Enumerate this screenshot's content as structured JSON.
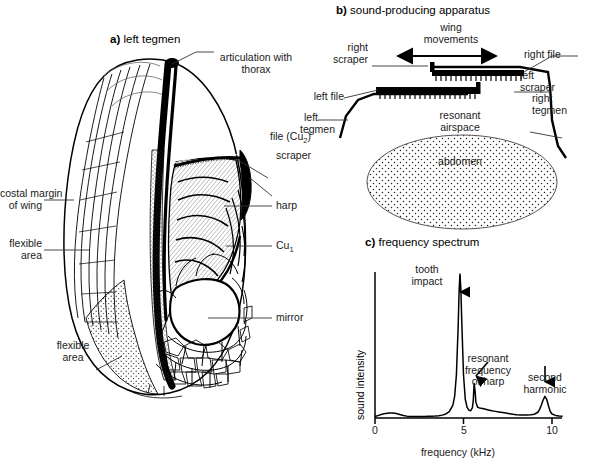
{
  "figure": {
    "panels": [
      {
        "id": "a",
        "marker": "a)",
        "title": "left tegmen",
        "labels": [
          {
            "name": "articulation-with-thorax",
            "text": "articulation with\nthorax"
          },
          {
            "name": "file-cu2",
            "text": "file (Cu2)"
          },
          {
            "name": "scraper",
            "text": "scraper"
          },
          {
            "name": "harp",
            "text": "harp"
          },
          {
            "name": "cu1",
            "text": "Cu1"
          },
          {
            "name": "mirror",
            "text": "mirror"
          },
          {
            "name": "costal-margin-of-wing",
            "text": "costal margin\nof wing"
          },
          {
            "name": "flexible-area-upper",
            "text": "flexible\narea"
          },
          {
            "name": "flexible-area-lower",
            "text": "flexible\narea"
          }
        ]
      },
      {
        "id": "b",
        "marker": "b)",
        "title": "sound-producing apparatus",
        "labels": [
          {
            "name": "wing-movements",
            "text": "wing\nmovements"
          },
          {
            "name": "right-scraper",
            "text": "right\nscraper"
          },
          {
            "name": "right-file",
            "text": "right file"
          },
          {
            "name": "left-file",
            "text": "left file"
          },
          {
            "name": "left-scraper",
            "text": "left\nscraper"
          },
          {
            "name": "left-tegmen",
            "text": "left\ntegmen"
          },
          {
            "name": "right-tegmen",
            "text": "right\ntegmen"
          },
          {
            "name": "resonant-airspace",
            "text": "resonant\nairspace"
          },
          {
            "name": "abdomen",
            "text": "abdomen"
          }
        ]
      },
      {
        "id": "c",
        "marker": "c)",
        "title": "frequency spectrum"
      }
    ]
  },
  "panel_a": {
    "marker": "a)",
    "title": "left tegmen",
    "articulation_line1": "articulation with",
    "articulation_line2": "thorax",
    "file_prefix": "file (Cu",
    "file_sub": "2",
    "file_suffix": ")",
    "scraper": "scraper",
    "harp": "harp",
    "cu1_prefix": "Cu",
    "cu1_sub": "1",
    "costal_line1": "costal margin",
    "costal_line2": "of wing",
    "flexible_line1": "flexible",
    "flexible_line2": "area",
    "mirror": "mirror"
  },
  "panel_b": {
    "marker": "b)",
    "title": "sound-producing apparatus",
    "wing_line1": "wing",
    "wing_line2": "movements",
    "right_scraper_l1": "right",
    "right_scraper_l2": "scraper",
    "right_file": "right file",
    "left_file": "left file",
    "left_scraper_l1": "left",
    "left_scraper_l2": "scraper",
    "left_tegmen_l1": "left",
    "left_tegmen_l2": "tegmen",
    "right_tegmen_l1": "right",
    "right_tegmen_l2": "tegmen",
    "resonant_l1": "resonant",
    "resonant_l2": "airspace",
    "abdomen": "abdomen"
  },
  "panel_c": {
    "marker": "c)",
    "title": "frequency spectrum",
    "annotations": {
      "tooth_impact_l1": "tooth",
      "tooth_impact_l2": "impact",
      "resonant_l1": "resonant",
      "resonant_l2": "frequency",
      "resonant_l3": "of harp",
      "second_harmonic_l1": "second",
      "second_harmonic_l2": "harmonic"
    }
  },
  "chart_data": {
    "type": "line",
    "title": "frequency spectrum",
    "xlabel": "frequency (kHz)",
    "ylabel": "sound intensity",
    "xlim": [
      0,
      10.6
    ],
    "ylim": [
      0,
      1.0
    ],
    "xticks": [
      0,
      5,
      10
    ],
    "xticklabels": [
      "0",
      "5",
      "10"
    ],
    "yticks": [],
    "grid": false,
    "legend": null,
    "annotations": [
      {
        "label": "tooth impact",
        "x": 4.8,
        "y": 1.0,
        "arrow": "down"
      },
      {
        "label": "resonant frequency of harp",
        "x": 5.6,
        "y": 0.24,
        "arrow": "down-left"
      },
      {
        "label": "second harmonic",
        "x": 9.6,
        "y": 0.15,
        "arrow": "down"
      }
    ],
    "peaks": [
      {
        "name": "low-frequency-bump",
        "center_khz": 0.9,
        "amplitude": 0.035,
        "width_khz": 0.55
      },
      {
        "name": "tooth-impact",
        "center_khz": 4.8,
        "amplitude": 1.0,
        "width_khz": 0.17
      },
      {
        "name": "resonant-frequency-of-harp",
        "center_khz": 5.6,
        "amplitude": 0.24,
        "width_khz": 0.13
      },
      {
        "name": "shoulder",
        "center_khz": 6.3,
        "amplitude": 0.06,
        "width_khz": 0.7
      },
      {
        "name": "second-harmonic",
        "center_khz": 9.6,
        "amplitude": 0.15,
        "width_khz": 0.2
      }
    ],
    "x": [
      0.0,
      0.2,
      0.4,
      0.6,
      0.8,
      1.0,
      1.2,
      1.4,
      1.6,
      1.8,
      2.0,
      2.2,
      2.4,
      2.6,
      2.8,
      3.0,
      3.2,
      3.4,
      3.6,
      3.8,
      4.0,
      4.2,
      4.4,
      4.5,
      4.6,
      4.7,
      4.75,
      4.8,
      4.85,
      4.9,
      5.0,
      5.1,
      5.2,
      5.3,
      5.4,
      5.5,
      5.55,
      5.6,
      5.65,
      5.7,
      5.8,
      5.9,
      6.0,
      6.2,
      6.4,
      6.6,
      6.8,
      7.0,
      7.2,
      7.4,
      7.6,
      7.8,
      8.0,
      8.2,
      8.4,
      8.6,
      8.8,
      9.0,
      9.2,
      9.3,
      9.4,
      9.5,
      9.6,
      9.7,
      9.8,
      9.9,
      10.0,
      10.2,
      10.4,
      10.6
    ],
    "y": [
      0.01,
      0.018,
      0.026,
      0.032,
      0.035,
      0.035,
      0.031,
      0.024,
      0.017,
      0.013,
      0.011,
      0.01,
      0.01,
      0.01,
      0.011,
      0.012,
      0.013,
      0.014,
      0.016,
      0.02,
      0.028,
      0.045,
      0.09,
      0.15,
      0.3,
      0.64,
      0.88,
      1.0,
      0.9,
      0.68,
      0.3,
      0.13,
      0.075,
      0.055,
      0.05,
      0.07,
      0.12,
      0.24,
      0.19,
      0.11,
      0.075,
      0.07,
      0.068,
      0.062,
      0.056,
      0.05,
      0.046,
      0.042,
      0.038,
      0.034,
      0.03,
      0.026,
      0.023,
      0.021,
      0.02,
      0.02,
      0.022,
      0.026,
      0.04,
      0.06,
      0.09,
      0.125,
      0.15,
      0.13,
      0.085,
      0.045,
      0.028,
      0.018,
      0.014,
      0.012
    ]
  }
}
